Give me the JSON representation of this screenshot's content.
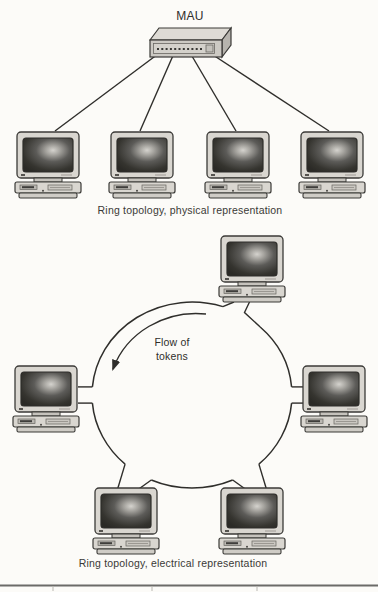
{
  "diagram": {
    "hub_label": "MAU",
    "physical": {
      "caption": "Ring topology, physical representation",
      "station_count": 4
    },
    "electrical": {
      "caption": "Ring topology, electrical representation",
      "station_count": 6,
      "flow_label_line1": "Flow of",
      "flow_label_line2": "tokens"
    },
    "colors": {
      "line": "#2f2e2b",
      "device_body": "#d9d6d0",
      "screen_dark": "#2b2a26",
      "screen_highlight": "#d5d3ce",
      "bottom_rule": "#6b6b68"
    }
  }
}
